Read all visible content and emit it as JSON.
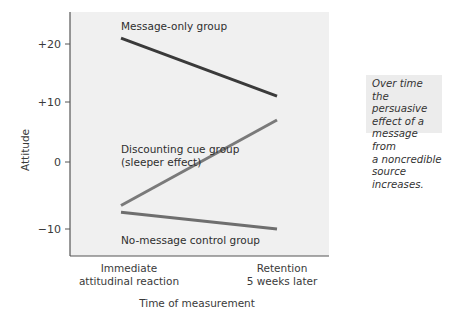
{
  "chart_data": {
    "type": "line",
    "title": "",
    "xlabel": "Time of measurement",
    "ylabel": "Attitude",
    "categories": [
      "Immediate\nattitudinal reaction",
      "Retention\n5 weeks later"
    ],
    "category_lines": [
      [
        "Immediate",
        "attitudinal reaction"
      ],
      [
        "Retention",
        "5 weeks later"
      ]
    ],
    "yticks": [
      {
        "value": 20,
        "label": "+20"
      },
      {
        "value": 10,
        "label": "+10"
      },
      {
        "value": 0,
        "label": "0"
      },
      {
        "value": -10,
        "label": "−10"
      }
    ],
    "ylim": [
      -13,
      25
    ],
    "grid": false,
    "legend": "inline labels",
    "series": [
      {
        "name": "Message-only group",
        "label_lines": [
          "Message-only group"
        ],
        "values": [
          21,
          11
        ],
        "color": "#3a3a3a"
      },
      {
        "name": "Discounting cue group (sleeper effect)",
        "label_lines": [
          "Discounting cue group",
          "(sleeper effect)"
        ],
        "values": [
          -6.5,
          7
        ],
        "color": "#7a7a7a"
      },
      {
        "name": "No-message control group",
        "label_lines": [
          "No-message control group"
        ],
        "values": [
          -7.5,
          -10
        ],
        "color": "#6e6e6e"
      }
    ],
    "annotation": "Over time the persuasive effect of a message from a noncredible source increases.",
    "annotation_lines": [
      "Over time the persuasive",
      "effect of a message from",
      "a noncredible source",
      "increases."
    ]
  },
  "colors": {
    "plot_background": "#f0f0f0",
    "annotation_background": "#ececec",
    "axis": "#555555"
  }
}
